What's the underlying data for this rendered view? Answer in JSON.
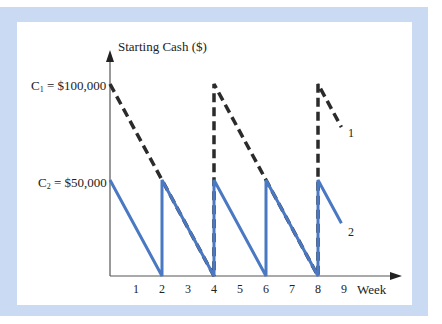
{
  "chart_data": {
    "type": "line",
    "title": "",
    "ylabel": "Starting Cash ($)",
    "xlabel": "Week",
    "x_ticks": [
      "1",
      "2",
      "3",
      "4",
      "5",
      "6",
      "7",
      "8",
      "9"
    ],
    "y_ticks": [
      {
        "label_prefix": "C",
        "label_sub": "1",
        "label_suffix": " = $100,000",
        "value": 100000
      },
      {
        "label_prefix": "C",
        "label_sub": "2",
        "label_suffix": " = $50,000",
        "value": 50000
      }
    ],
    "xlim": [
      0,
      9.5
    ],
    "ylim": [
      0,
      110000
    ],
    "grid": false,
    "legend": "inline end labels",
    "series": [
      {
        "name": "1",
        "style": "dashed",
        "color": "#2b2b2b",
        "points": [
          [
            0,
            100000
          ],
          [
            4,
            0
          ],
          [
            4,
            100000
          ],
          [
            8,
            0
          ],
          [
            8,
            100000
          ],
          [
            8.9,
            77500
          ]
        ]
      },
      {
        "name": "2",
        "style": "solid",
        "color": "#4a78c2",
        "points": [
          [
            0,
            50000
          ],
          [
            2,
            0
          ],
          [
            2,
            50000
          ],
          [
            4,
            0
          ],
          [
            4,
            50000
          ],
          [
            6,
            0
          ],
          [
            6,
            50000
          ],
          [
            8,
            0
          ],
          [
            8,
            50000
          ],
          [
            8.9,
            27500
          ]
        ]
      }
    ]
  },
  "colors": {
    "frame": "#c9daf2",
    "panel": "#ffffff",
    "axis": "#444444"
  }
}
